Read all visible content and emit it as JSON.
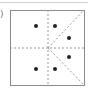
{
  "figure": {
    "label": ")",
    "frame": {
      "x": 10,
      "y": 10,
      "w": 74,
      "h": 75,
      "color": "#8a8a8a"
    },
    "center": {
      "x": 48,
      "y": 48
    },
    "dash_color": "#9a9a9a",
    "dot_color": "#222222",
    "dots": [
      {
        "x": 36,
        "y": 26
      },
      {
        "x": 55,
        "y": 26
      },
      {
        "x": 69,
        "y": 38
      },
      {
        "x": 69,
        "y": 57
      },
      {
        "x": 36,
        "y": 69
      },
      {
        "x": 55,
        "y": 69
      }
    ]
  }
}
